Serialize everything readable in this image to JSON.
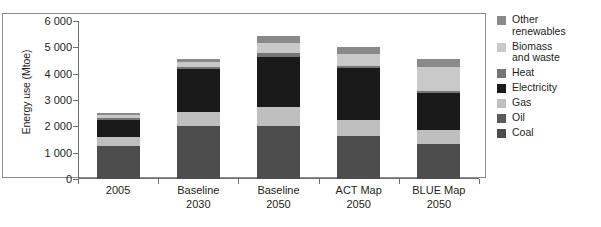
{
  "chart_data": {
    "type": "bar",
    "subtype": "stacked-bar",
    "title": "",
    "xlabel": "",
    "ylabel": "Energy use (Mtoe)",
    "ylim": [
      0,
      6000
    ],
    "yticks": [
      0,
      1000,
      2000,
      3000,
      4000,
      5000,
      6000
    ],
    "ytick_labels": [
      "0",
      "1 000",
      "2 000",
      "3 000",
      "4 000",
      "5 000",
      "6 000"
    ],
    "grid": false,
    "legend_position": "right",
    "categories": [
      "2005",
      "Baseline\n2030",
      "Baseline\n2050",
      "ACT Map\n2050",
      "BLUE Map\n2050"
    ],
    "category_labels": [
      "2005",
      "Baseline 2030",
      "Baseline 2050",
      "ACT Map 2050",
      "BLUE Map 2050"
    ],
    "series": [
      {
        "name": "Coal",
        "color": "#4d4d4d",
        "values": [
          1250,
          2000,
          2020,
          1650,
          1330
        ]
      },
      {
        "name": "Oil",
        "color": "#5a5a5a",
        "values": [
          0,
          0,
          0,
          0,
          0
        ]
      },
      {
        "name": "Gas",
        "color": "#bfbfbf",
        "values": [
          330,
          530,
          700,
          580,
          530
        ]
      },
      {
        "name": "Electricity",
        "color": "#1a1a1a",
        "values": [
          680,
          1630,
          1930,
          1990,
          1420
        ]
      },
      {
        "name": "Heat",
        "color": "#757575",
        "values": [
          60,
          110,
          120,
          90,
          60
        ]
      },
      {
        "name": "Biomass and waste",
        "color": "#c9c9c9",
        "values": [
          120,
          180,
          380,
          450,
          900
        ]
      },
      {
        "name": "Other renewables",
        "color": "#8a8a8a",
        "values": [
          60,
          100,
          300,
          240,
          310
        ]
      }
    ],
    "totals": [
      2500,
      4550,
      5450,
      5000,
      4550
    ],
    "legend_entries": [
      "Other\nrenewables",
      "Biomass\nand waste",
      "Heat",
      "Electricity",
      "Gas",
      "Oil",
      "Coal"
    ],
    "legend_colors": [
      "#8a8a8a",
      "#c9c9c9",
      "#757575",
      "#1a1a1a",
      "#bfbfbf",
      "#5a5a5a",
      "#4d4d4d"
    ]
  },
  "axis": {
    "ylabel": "Energy use (Mtoe)",
    "ytick_0": "0",
    "ytick_1": "1 000",
    "ytick_2": "2 000",
    "ytick_3": "3 000",
    "ytick_4": "4 000",
    "ytick_5": "5 000",
    "ytick_6": "6 000"
  },
  "xlabels": {
    "c0": "2005",
    "c1": "Baseline\n2030",
    "c2": "Baseline\n2050",
    "c3": "ACT Map\n2050",
    "c4": "BLUE Map\n2050"
  },
  "legend": {
    "items": [
      {
        "label": "Other\nrenewables",
        "color": "#8a8a8a",
        "icon": "legend-swatch-icon"
      },
      {
        "label": "Biomass\nand waste",
        "color": "#c9c9c9",
        "icon": "legend-swatch-icon"
      },
      {
        "label": "Heat",
        "color": "#757575",
        "icon": "legend-swatch-icon"
      },
      {
        "label": "Electricity",
        "color": "#1a1a1a",
        "icon": "legend-swatch-icon"
      },
      {
        "label": "Gas",
        "color": "#bfbfbf",
        "icon": "legend-swatch-icon"
      },
      {
        "label": "Oil",
        "color": "#5a5a5a",
        "icon": "legend-swatch-icon"
      },
      {
        "label": "Coal",
        "color": "#4d4d4d",
        "icon": "legend-swatch-icon"
      }
    ]
  }
}
